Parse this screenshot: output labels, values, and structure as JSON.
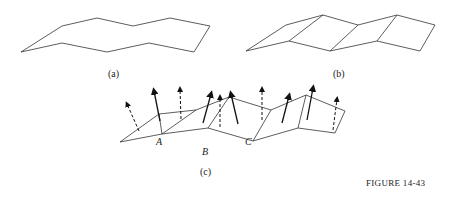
{
  "figure": {
    "caption": "FIGURE 14-43",
    "panels": [
      {
        "id": "a",
        "label": "(a)",
        "description": "Zigzag strip outline"
      },
      {
        "id": "b",
        "label": "(b)",
        "description": "Zigzag strip divided into quadrilateral facets"
      },
      {
        "id": "c",
        "label": "(c)",
        "description": "Faceted strip with surface normal vectors; solid and dashed arrows"
      }
    ],
    "points": [
      "A",
      "B",
      "C"
    ]
  }
}
